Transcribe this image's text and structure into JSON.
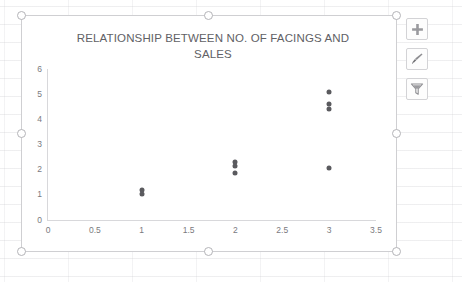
{
  "application": "excel-chart-object",
  "chart": {
    "title": "RELATIONSHIP BETWEEN NO. OF FACINGS AND\nSALES",
    "title_line1": "RELATIONSHIP BETWEEN NO. OF FACINGS AND",
    "title_line2": "SALES",
    "selected": true,
    "marker_color": "#5a5a5e",
    "axis_color": "#d8d8db",
    "tick_label_color": "#7a7a7e",
    "title_color": "#616165"
  },
  "chart_data": {
    "type": "scatter",
    "title": "RELATIONSHIP BETWEEN NO. OF FACINGS AND SALES",
    "xlabel": "",
    "ylabel": "",
    "xlim": [
      0,
      3.5
    ],
    "ylim": [
      0,
      6
    ],
    "grid": false,
    "legend": false,
    "xticks": [
      "0",
      "0.5",
      "1",
      "1.5",
      "2",
      "2.5",
      "3",
      "3.5"
    ],
    "xtick_values": [
      0,
      0.5,
      1,
      1.5,
      2,
      2.5,
      3,
      3.5
    ],
    "yticks": [
      "0",
      "1",
      "2",
      "3",
      "4",
      "5",
      "6"
    ],
    "ytick_values": [
      0,
      1,
      2,
      3,
      4,
      5,
      6
    ],
    "series": [
      {
        "name": "Sales vs Facings",
        "points": [
          {
            "x": 1,
            "y": 1.05
          },
          {
            "x": 1,
            "y": 1.2
          },
          {
            "x": 2,
            "y": 1.85
          },
          {
            "x": 2,
            "y": 2.15
          },
          {
            "x": 2,
            "y": 2.3
          },
          {
            "x": 3,
            "y": 2.05
          },
          {
            "x": 3,
            "y": 4.4
          },
          {
            "x": 3,
            "y": 4.6
          },
          {
            "x": 3,
            "y": 5.1
          }
        ]
      }
    ]
  },
  "chart_buttons": [
    {
      "name": "chart-elements-button",
      "icon": "plus-icon",
      "label": "Chart Elements"
    },
    {
      "name": "chart-styles-button",
      "icon": "paintbrush-icon",
      "label": "Chart Styles"
    },
    {
      "name": "chart-filters-button",
      "icon": "funnel-icon",
      "label": "Chart Filters"
    }
  ],
  "selection_handles": [
    "top-left",
    "top-center",
    "top-right",
    "middle-left",
    "middle-right",
    "bottom-left",
    "bottom-center",
    "bottom-right"
  ]
}
